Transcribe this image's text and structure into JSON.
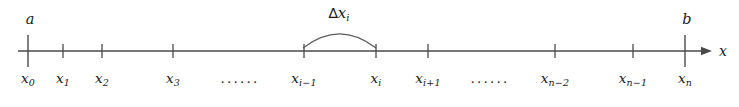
{
  "figure": {
    "axis_label": "x",
    "interval_start_label": "a",
    "interval_end_label": "b",
    "delta_label": {
      "delta": "∆",
      "base": "x",
      "sub": "i"
    },
    "colors": {
      "background": "#ffffff",
      "line": "#4a4a4a",
      "text": "#1a1a1a",
      "arc": "#5a5a5a"
    },
    "axis": {
      "y": 51,
      "x_start": 18,
      "x_end": 712,
      "arrow_tip_x": 712,
      "axis_name_x": 723
    },
    "ticks": [
      {
        "id": "x0",
        "x": 28,
        "base": "x",
        "sub": "0",
        "tall": true
      },
      {
        "id": "x1",
        "x": 63,
        "base": "x",
        "sub": "1",
        "tall": false
      },
      {
        "id": "x2",
        "x": 102,
        "base": "x",
        "sub": "2",
        "tall": false
      },
      {
        "id": "x3",
        "x": 173,
        "base": "x",
        "sub": "3",
        "tall": false
      },
      {
        "id": "xi-1",
        "x": 304,
        "base": "x",
        "sub": "i−1",
        "tall": false
      },
      {
        "id": "xi",
        "x": 376,
        "base": "x",
        "sub": "i",
        "tall": false
      },
      {
        "id": "xi+1",
        "x": 428,
        "base": "x",
        "sub": "i+1",
        "tall": false
      },
      {
        "id": "xn-2",
        "x": 555,
        "base": "x",
        "sub": "n−2",
        "tall": false
      },
      {
        "id": "xn-1",
        "x": 633,
        "base": "x",
        "sub": "n−1",
        "tall": false
      },
      {
        "id": "xn",
        "x": 685,
        "base": "x",
        "sub": "n",
        "tall": true
      }
    ],
    "ellipses": [
      {
        "id": "ellipsis-left",
        "x": 240,
        "text": "······"
      },
      {
        "id": "ellipsis-right",
        "x": 490,
        "text": "······"
      }
    ],
    "arc": {
      "start_x": 303,
      "end_x": 376,
      "base_y": 48,
      "apex_y": 28,
      "label_x": 339,
      "label_y": 6
    },
    "endpoints": [
      {
        "id": "a",
        "label": "a",
        "x": 30,
        "tick_x": 28
      },
      {
        "id": "b",
        "label": "b",
        "x": 687,
        "tick_x": 685
      }
    ]
  }
}
